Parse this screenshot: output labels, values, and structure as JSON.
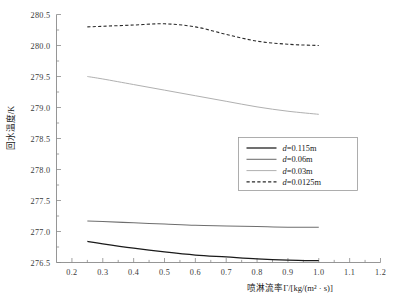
{
  "chart_data": {
    "type": "line",
    "title": "",
    "xlabel": "喷淋流率Γ/[kg/(m² · s)]",
    "ylabel": "回水温度/K",
    "xlim": [
      0.15,
      1.2
    ],
    "ylim": [
      276.5,
      280.5
    ],
    "xticks": [
      "0.2",
      "0.3",
      "0.4",
      "0.5",
      "0.6",
      "0.7",
      "0.8",
      "0.9",
      "1.0",
      "1.1",
      "1.2"
    ],
    "xtick_values": [
      0.2,
      0.3,
      0.4,
      0.5,
      0.6,
      0.7,
      0.8,
      0.9,
      1.0,
      1.1,
      1.2
    ],
    "yticks": [
      "276.5",
      "277.0",
      "277.5",
      "278.0",
      "278.5",
      "279.0",
      "279.5",
      "280.0",
      "280.5"
    ],
    "ytick_values": [
      276.5,
      277.0,
      277.5,
      278.0,
      278.5,
      279.0,
      279.5,
      280.0,
      280.5
    ],
    "grid": false,
    "legend_position": "center-right",
    "x": [
      0.25,
      0.3,
      0.4,
      0.5,
      0.6,
      0.7,
      0.8,
      0.9,
      1.0
    ],
    "series": [
      {
        "name": "d=0.115m",
        "label_prefix": "d",
        "label_suffix": "=0.115m",
        "style": "solid",
        "color": "#1a1a1a",
        "width": 1.25,
        "values": [
          276.84,
          276.8,
          276.73,
          276.67,
          276.62,
          276.59,
          276.56,
          276.54,
          276.53
        ]
      },
      {
        "name": "d=0.06m",
        "label_prefix": "d",
        "label_suffix": "=0.06m",
        "style": "solid",
        "color": "#6e6e6e",
        "width": 1.05,
        "values": [
          277.17,
          277.16,
          277.14,
          277.12,
          277.1,
          277.09,
          277.08,
          277.07,
          277.07
        ]
      },
      {
        "name": "d=0.03m",
        "label_prefix": "d",
        "label_suffix": "=0.03m",
        "style": "solid",
        "color": "#b0b0b0",
        "width": 1.0,
        "values": [
          279.5,
          279.46,
          279.37,
          279.28,
          279.19,
          279.1,
          279.01,
          278.94,
          278.89
        ]
      },
      {
        "name": "d=0.0125m",
        "label_prefix": "d",
        "label_suffix": "=0.0125m",
        "style": "dashed",
        "color": "#2a2a2a",
        "width": 1.1,
        "values": [
          280.3,
          280.31,
          280.33,
          280.35,
          280.3,
          280.18,
          280.07,
          280.02,
          280.0
        ]
      }
    ]
  }
}
